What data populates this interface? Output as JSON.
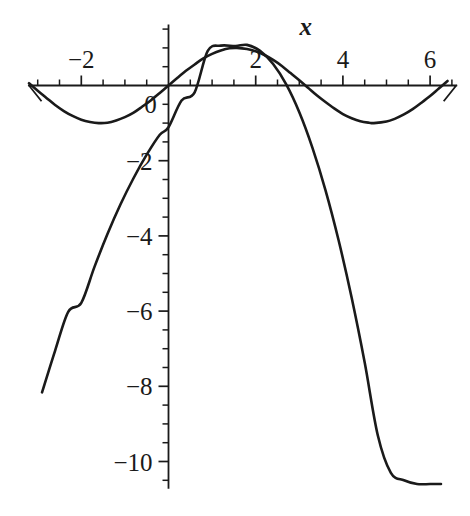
{
  "chart_data": {
    "type": "line",
    "title": "",
    "subtitle": "",
    "xlabel": "x",
    "ylabel": "",
    "xlim": [
      -3.2,
      6.6
    ],
    "ylim": [
      -10.7,
      1.6
    ],
    "grid": false,
    "legend": "none",
    "x_ticks_major": [
      -2,
      0,
      2,
      4,
      6
    ],
    "x_tick_labels": [
      "-2",
      "0",
      "2",
      "4",
      "6"
    ],
    "x_tick_minor_step": 0.5,
    "y_ticks_major": [
      -2,
      -4,
      -6,
      -8,
      -10
    ],
    "y_tick_labels": [
      "-2",
      "-4",
      "-6",
      "-8",
      "-10"
    ],
    "y_tick_minor_step": 0.5,
    "axis_arrow_x": true,
    "series": [
      {
        "name": "sine",
        "formula": "sin(x)",
        "x": [
          -3.2,
          -3.0,
          -2.8,
          -2.6,
          -2.4,
          -2.2,
          -2.0,
          -1.8,
          -1.6,
          -1.4,
          -1.2,
          -1.0,
          -0.8,
          -0.6,
          -0.4,
          -0.2,
          0.0,
          0.2,
          0.4,
          0.6,
          0.8,
          1.0,
          1.2,
          1.4,
          1.57,
          1.8,
          2.0,
          2.2,
          2.4,
          2.6,
          2.8,
          3.0,
          3.2,
          3.4,
          3.6,
          3.8,
          4.0,
          4.2,
          4.4,
          4.6,
          4.71,
          5.0,
          5.2,
          5.4,
          5.6,
          5.8,
          6.0,
          6.2,
          6.4
        ],
        "y": [
          0.06,
          -0.14,
          -0.33,
          -0.52,
          -0.68,
          -0.81,
          -0.91,
          -0.97,
          -1.0,
          -0.99,
          -0.93,
          -0.84,
          -0.72,
          -0.56,
          -0.39,
          -0.2,
          0.0,
          0.2,
          0.39,
          0.56,
          0.72,
          0.84,
          0.93,
          0.99,
          1.0,
          0.97,
          0.91,
          0.81,
          0.68,
          0.52,
          0.33,
          0.14,
          -0.06,
          -0.26,
          -0.44,
          -0.61,
          -0.76,
          -0.87,
          -0.95,
          -0.99,
          -1.0,
          -0.96,
          -0.88,
          -0.77,
          -0.63,
          -0.46,
          -0.28,
          -0.08,
          0.12
        ]
      },
      {
        "name": "parabola",
        "formula": "-0.47x^2 + 1.45x",
        "x": [
          -2.9,
          -2.6,
          -2.3,
          -2.0,
          -1.7,
          -1.4,
          -1.1,
          -0.8,
          -0.5,
          -0.2,
          0.0,
          0.3,
          0.6,
          0.9,
          1.2,
          1.54,
          1.8,
          2.1,
          2.4,
          2.7,
          3.0,
          3.3,
          3.6,
          3.9,
          4.2,
          4.5,
          4.8,
          5.1,
          5.4,
          5.7,
          6.0,
          6.25
        ],
        "y": [
          -8.16,
          -7.05,
          -6.02,
          -5.78,
          -4.83,
          -3.95,
          -3.16,
          -2.46,
          -1.84,
          -1.31,
          -1.11,
          -0.4,
          -0.18,
          0.92,
          1.06,
          1.05,
          1.08,
          0.92,
          0.57,
          0.03,
          -0.71,
          -1.65,
          -2.78,
          -4.11,
          -5.64,
          -7.37,
          -9.3,
          -10.3,
          -10.5,
          -10.6,
          -10.6,
          -10.6
        ]
      }
    ],
    "annotations": [
      {
        "text": "x",
        "role": "x-axis-label",
        "x": 3.15,
        "y": 1.35,
        "italic": true
      }
    ]
  }
}
